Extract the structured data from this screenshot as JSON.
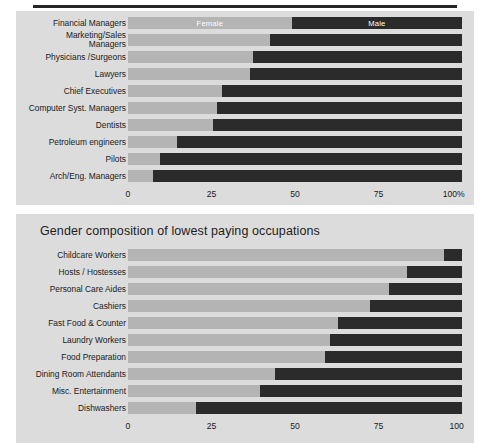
{
  "figure": {
    "background": "#dcdcdc",
    "female_color": "#b4b4b4",
    "male_color": "#2b2b2b"
  },
  "panels": {
    "top": {
      "title": "",
      "legend": {
        "female": "Female",
        "male": "Male"
      },
      "axis_ticks": [
        "0",
        "25",
        "50",
        "75",
        "100%"
      ]
    },
    "bottom": {
      "title": "Gender composition of lowest paying occupations",
      "axis_ticks": [
        "0",
        "25",
        "50",
        "75",
        "100"
      ]
    }
  },
  "chart_data": [
    {
      "type": "bar",
      "orientation": "horizontal",
      "stacked": true,
      "normalized": true,
      "title": "",
      "xlabel": "",
      "ylabel": "",
      "xlim": [
        0,
        100
      ],
      "grid": false,
      "legend": [
        "Female",
        "Male"
      ],
      "legend_position": "in-bars-top-row",
      "categories": [
        "Financial Managers",
        "Marketing/Sales Managers",
        "Physicians /Surgeons",
        "Lawyers",
        "Chief Executives",
        "Computer Syst. Managers",
        "Dentists",
        "Petroleum engineers",
        "Pilots",
        "Arch/Eng. Managers"
      ],
      "series": [
        {
          "name": "Female",
          "values": [
            49,
            42.5,
            37.5,
            36.5,
            28,
            26.5,
            25.5,
            14.7,
            9.6,
            7.5
          ]
        },
        {
          "name": "Male",
          "values": [
            51,
            57.5,
            62.5,
            63.5,
            72,
            73.5,
            74.5,
            85.3,
            90.4,
            92.5
          ]
        }
      ],
      "tick_labels": [
        "0",
        "25",
        "50",
        "75",
        "100%"
      ]
    },
    {
      "type": "bar",
      "orientation": "horizontal",
      "stacked": true,
      "normalized": true,
      "title": "Gender composition of lowest paying occupations",
      "xlabel": "",
      "ylabel": "",
      "xlim": [
        0,
        100
      ],
      "grid": false,
      "legend": [
        "Female",
        "Male"
      ],
      "legend_position": "none",
      "categories": [
        "Childcare Workers",
        "Hosts / Hostesses",
        "Personal Care Aides",
        "Cashiers",
        "Fast Food & Counter",
        "Laundry Workers",
        "Food Preparation",
        "Dining Room Attendants",
        "Misc. Entertainment",
        "Dishwashers"
      ],
      "series": [
        {
          "name": "Female",
          "values": [
            94.5,
            83.5,
            78,
            72.5,
            63,
            60.5,
            59,
            44,
            39.5,
            20.5
          ]
        },
        {
          "name": "Male",
          "values": [
            5.5,
            16.5,
            22,
            27.5,
            37,
            39.5,
            41,
            56,
            60.5,
            79.5
          ]
        }
      ],
      "tick_labels": [
        "0",
        "25",
        "50",
        "75",
        "100"
      ]
    }
  ]
}
